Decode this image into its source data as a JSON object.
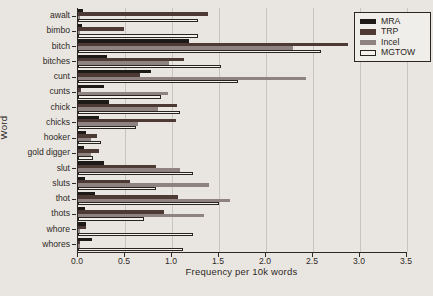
{
  "figure": {
    "background": "#e9e6e1",
    "text_color": "#2e2925",
    "grid_color": "#c8c4be",
    "axis_color": "#2e2925"
  },
  "chart_data": {
    "type": "bar",
    "orientation": "horizontal",
    "title": "",
    "xlabel": "Frequency per 10k words",
    "ylabel": "Word",
    "xlim": [
      0,
      3.5
    ],
    "xtick_labels": [
      "0.0",
      "0.5",
      "1.0",
      "1.5",
      "2.0",
      "2.5",
      "3.0",
      "3.5"
    ],
    "grid": true,
    "legend_position": "upper-right",
    "categories": [
      "awalt",
      "bimbo",
      "bitch",
      "bitches",
      "cunt",
      "cunts",
      "chick",
      "chicks",
      "hooker",
      "gold digger",
      "slut",
      "sluts",
      "thot",
      "thots",
      "whore",
      "whores"
    ],
    "series": [
      {
        "name": "MRA",
        "color": "#1e1a17",
        "values": [
          0.05,
          0.04,
          1.18,
          0.31,
          0.78,
          0.28,
          0.33,
          0.22,
          0.08,
          0.06,
          0.28,
          0.07,
          0.18,
          0.07,
          0.09,
          0.15
        ]
      },
      {
        "name": "TRP",
        "color": "#4e3a35",
        "values": [
          1.38,
          0.49,
          2.87,
          1.13,
          0.66,
          0.03,
          1.05,
          1.04,
          0.2,
          0.22,
          0.83,
          0.55,
          1.06,
          0.91,
          0.09,
          0.02
        ]
      },
      {
        "name": "Incel",
        "color": "#8e8380",
        "values": [
          0.02,
          0.02,
          2.29,
          0.97,
          2.43,
          0.96,
          0.85,
          0.64,
          0.14,
          0.14,
          1.09,
          1.39,
          1.62,
          1.34,
          0.02,
          0.02
        ]
      },
      {
        "name": "MGTOW",
        "color": "#f4f2ed",
        "border_color": "#29241f",
        "values": [
          1.28,
          1.28,
          2.59,
          1.52,
          1.7,
          0.88,
          1.09,
          0.62,
          0.24,
          0.16,
          1.22,
          0.83,
          1.5,
          0.7,
          1.22,
          1.12
        ]
      }
    ]
  }
}
